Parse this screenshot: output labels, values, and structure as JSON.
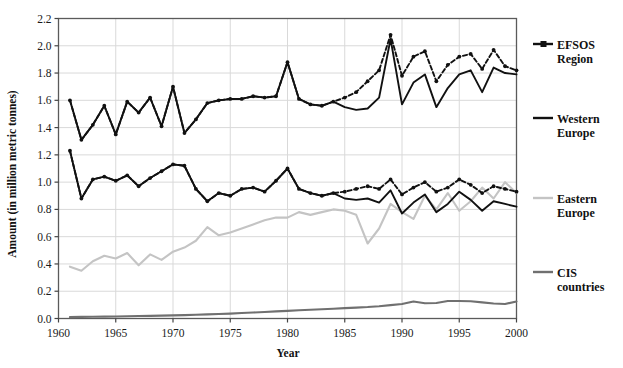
{
  "chart_data": {
    "type": "line",
    "title": "",
    "xlabel": "Year",
    "ylabel": "Amount (in million metric tonnes)",
    "xlim": [
      1960,
      2000
    ],
    "ylim": [
      0.0,
      2.2
    ],
    "xticks": [
      1960,
      1965,
      1970,
      1975,
      1980,
      1985,
      1990,
      1995,
      2000
    ],
    "yticks": [
      0.0,
      0.2,
      0.4,
      0.6,
      0.8,
      1.0,
      1.2,
      1.4,
      1.6,
      1.8,
      2.0,
      2.2
    ],
    "ytick_labels": [
      "0.0",
      "0.2",
      "0.4",
      "0.6",
      "0.8",
      "1.0",
      "1.2",
      "1.4",
      "1.6",
      "1.8",
      "2.0",
      "2.2"
    ],
    "xtick_labels": [
      "1960",
      "1965",
      "1970",
      "1975",
      "1980",
      "1985",
      "1990",
      "1995",
      "2000"
    ],
    "grid": true,
    "grid_color": "#d9d9d9",
    "legend_position": "right",
    "x": [
      1961,
      1962,
      1963,
      1964,
      1965,
      1966,
      1967,
      1968,
      1969,
      1970,
      1971,
      1972,
      1973,
      1974,
      1975,
      1976,
      1977,
      1978,
      1979,
      1980,
      1981,
      1982,
      1983,
      1984,
      1985,
      1986,
      1987,
      1988,
      1989,
      1990,
      1991,
      1992,
      1993,
      1994,
      1995,
      1996,
      1997,
      1998,
      1999,
      2000
    ],
    "series": [
      {
        "name": "EFSOS Region",
        "color": "#111111",
        "style": "dotted-with-markers",
        "values": [
          1.6,
          1.31,
          1.42,
          1.56,
          1.35,
          1.59,
          1.51,
          1.62,
          1.41,
          1.7,
          1.36,
          1.46,
          1.58,
          1.6,
          1.61,
          1.61,
          1.63,
          1.62,
          1.63,
          1.88,
          1.61,
          1.57,
          1.56,
          1.59,
          1.62,
          1.66,
          1.74,
          1.82,
          2.08,
          1.78,
          1.92,
          1.96,
          1.74,
          1.86,
          1.92,
          1.94,
          1.83,
          1.97,
          1.85,
          1.82
        ]
      },
      {
        "name": "Western Europe",
        "color": "#111111",
        "style": "solid",
        "values": [
          1.6,
          1.31,
          1.42,
          1.56,
          1.35,
          1.59,
          1.51,
          1.62,
          1.41,
          1.7,
          1.36,
          1.46,
          1.58,
          1.6,
          1.61,
          1.61,
          1.63,
          1.62,
          1.63,
          1.88,
          1.61,
          1.57,
          1.56,
          1.59,
          1.55,
          1.53,
          1.54,
          1.62,
          2.05,
          1.57,
          1.73,
          1.79,
          1.55,
          1.69,
          1.79,
          1.82,
          1.66,
          1.84,
          1.8,
          1.79
        ]
      },
      {
        "name": "Western Europe (lower)",
        "color": "#111111",
        "style": "solid",
        "values": [
          1.23,
          0.88,
          1.02,
          1.04,
          1.01,
          1.05,
          0.97,
          1.03,
          1.08,
          1.13,
          1.12,
          0.95,
          0.86,
          0.92,
          0.9,
          0.95,
          0.96,
          0.93,
          1.01,
          1.1,
          0.95,
          0.92,
          0.9,
          0.92,
          0.88,
          0.87,
          0.88,
          0.85,
          0.94,
          0.77,
          0.85,
          0.91,
          0.78,
          0.84,
          0.93,
          0.87,
          0.79,
          0.86,
          0.84,
          0.82
        ]
      },
      {
        "name": "EFSOS Region (lower)",
        "color": "#111111",
        "style": "dotted-with-markers",
        "values": [
          1.23,
          0.88,
          1.02,
          1.04,
          1.01,
          1.05,
          0.97,
          1.03,
          1.08,
          1.13,
          1.12,
          0.95,
          0.86,
          0.92,
          0.9,
          0.95,
          0.96,
          0.93,
          1.01,
          1.1,
          0.95,
          0.92,
          0.9,
          0.92,
          0.93,
          0.95,
          0.97,
          0.95,
          1.02,
          0.91,
          0.96,
          1.0,
          0.93,
          0.96,
          1.02,
          0.98,
          0.92,
          0.97,
          0.95,
          0.93
        ]
      },
      {
        "name": "Eastern Europe",
        "color": "#c4c4c4",
        "style": "solid",
        "values": [
          0.38,
          0.35,
          0.42,
          0.46,
          0.44,
          0.48,
          0.39,
          0.47,
          0.43,
          0.49,
          0.52,
          0.57,
          0.67,
          0.61,
          0.63,
          0.66,
          0.69,
          0.72,
          0.74,
          0.74,
          0.78,
          0.76,
          0.78,
          0.8,
          0.79,
          0.76,
          0.55,
          0.66,
          0.84,
          0.78,
          0.73,
          0.9,
          0.8,
          0.92,
          0.79,
          0.86,
          0.96,
          0.88,
          1.0,
          0.92
        ]
      },
      {
        "name": "CIS countries",
        "color": "#707070",
        "style": "solid",
        "values": [
          0.01,
          0.012,
          0.013,
          0.014,
          0.015,
          0.016,
          0.018,
          0.019,
          0.021,
          0.023,
          0.025,
          0.028,
          0.03,
          0.033,
          0.036,
          0.04,
          0.044,
          0.048,
          0.052,
          0.056,
          0.06,
          0.064,
          0.068,
          0.072,
          0.076,
          0.08,
          0.084,
          0.09,
          0.098,
          0.106,
          0.125,
          0.112,
          0.114,
          0.128,
          0.128,
          0.126,
          0.118,
          0.11,
          0.106,
          0.125
        ]
      }
    ],
    "legend_entries": [
      {
        "label_line1": "EFSOS",
        "label_line2": "Region",
        "color": "#111111",
        "marker": true
      },
      {
        "label_line1": "Western",
        "label_line2": "Europe",
        "color": "#111111",
        "marker": false
      },
      {
        "label_line1": "Eastern",
        "label_line2": "Europe",
        "color": "#c4c4c4",
        "marker": false
      },
      {
        "label_line1": "CIS",
        "label_line2": "countries",
        "color": "#707070",
        "marker": false
      }
    ]
  }
}
